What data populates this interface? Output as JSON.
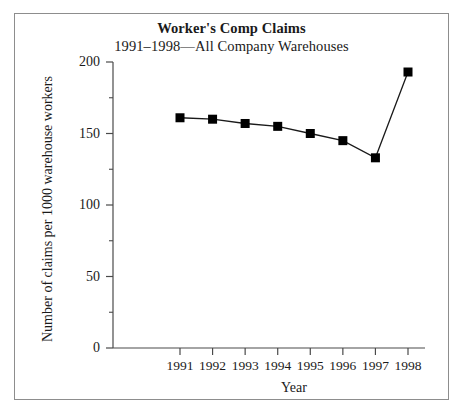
{
  "chart_data": {
    "type": "line",
    "title": "Worker's Comp Claims",
    "subtitle": "1991–1998—All Company Warehouses",
    "xlabel": "Year",
    "ylabel": "Number of claims per 1000 warehouse workers",
    "categories": [
      "1991",
      "1992",
      "1993",
      "1994",
      "1995",
      "1996",
      "1997",
      "1998"
    ],
    "values": [
      161,
      160,
      157,
      155,
      150,
      145,
      133,
      193
    ],
    "series": [
      {
        "name": "Claims per 1000 warehouse workers",
        "values": [
          161,
          160,
          157,
          155,
          150,
          145,
          133,
          193
        ]
      }
    ],
    "xlim": [
      1990.5,
      1998.5
    ],
    "ylim": [
      0,
      200
    ],
    "ytick_labels": [
      "0",
      "50",
      "100",
      "150",
      "200"
    ],
    "ytick_values": [
      0,
      50,
      100,
      150,
      200
    ],
    "yminor_tick_values": [
      25,
      75,
      125,
      175
    ],
    "xtick_labels": [
      "1991",
      "1992",
      "1993",
      "1994",
      "1995",
      "1996",
      "1997",
      "1998"
    ],
    "grid": false,
    "legend": "none",
    "marker": "square",
    "marker_color": "#000000",
    "line_color": "#1a1a1a",
    "axis_color": "#4a4a4a",
    "border_color": "#8d8d8d",
    "background_color": "#ffffff"
  }
}
